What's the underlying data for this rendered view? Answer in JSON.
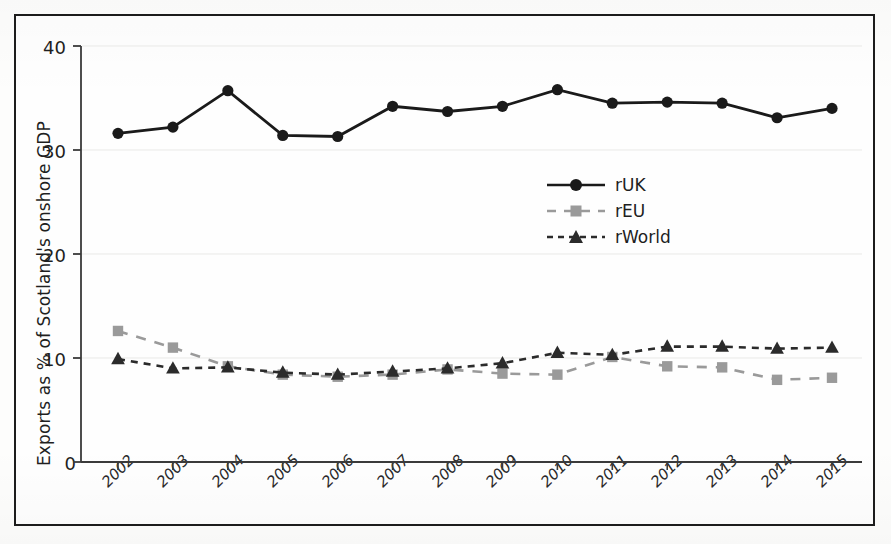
{
  "figure": {
    "background_color": "#fefefe",
    "frame_color": "#1c1c1c"
  },
  "chart_data": {
    "type": "line",
    "title": "",
    "xlabel": "",
    "ylabel": "Exports as % of Scotland's onshore GDP",
    "categories": [
      "2002",
      "2003",
      "2004",
      "2005",
      "2006",
      "2007",
      "2008",
      "2009",
      "2010",
      "2011",
      "2012",
      "2013",
      "2014",
      "2015"
    ],
    "x": [
      2002,
      2003,
      2004,
      2005,
      2006,
      2007,
      2008,
      2009,
      2010,
      2011,
      2012,
      2013,
      2014,
      2015
    ],
    "ylim": [
      0,
      40
    ],
    "yticks": [
      0,
      10,
      20,
      30,
      40
    ],
    "grid": false,
    "legend_position": "center-right",
    "series": [
      {
        "name": "rUK",
        "color": "#1a1a1a",
        "marker": "circle",
        "linestyle": "solid",
        "values": [
          31.6,
          32.2,
          35.7,
          31.4,
          31.3,
          34.2,
          33.7,
          34.2,
          35.8,
          34.5,
          34.6,
          34.5,
          33.1,
          34.0
        ]
      },
      {
        "name": "rEU",
        "color": "#9a9a9a",
        "marker": "square",
        "linestyle": "dashed",
        "values": [
          12.6,
          11.0,
          9.2,
          8.4,
          8.2,
          8.4,
          8.9,
          8.5,
          8.4,
          10.1,
          9.2,
          9.1,
          7.9,
          8.1
        ]
      },
      {
        "name": "rWorld",
        "color": "#2b2b2b",
        "marker": "triangle",
        "linestyle": "dashed",
        "values": [
          9.9,
          9.0,
          9.1,
          8.6,
          8.4,
          8.7,
          9.0,
          9.5,
          10.5,
          10.3,
          11.1,
          11.1,
          10.9,
          11.0
        ]
      }
    ]
  },
  "axes": {
    "ytick_labels": [
      "0",
      "10",
      "20",
      "30",
      "40"
    ],
    "xtick_labels": [
      "2002",
      "2003",
      "2004",
      "2005",
      "2006",
      "2007",
      "2008",
      "2009",
      "2010",
      "2011",
      "2012",
      "2013",
      "2014",
      "2015"
    ]
  },
  "legend": {
    "entries": [
      {
        "label": "rUK"
      },
      {
        "label": "rEU"
      },
      {
        "label": "rWorld"
      }
    ]
  }
}
